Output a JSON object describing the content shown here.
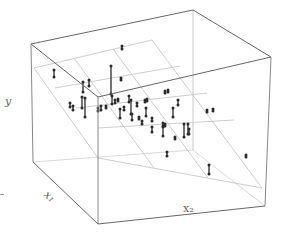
{
  "chart_data": {
    "type": "scatter3d",
    "title": "",
    "xlabel": "x1",
    "x2label": "x2",
    "ylabel": "y",
    "grid": false,
    "legend": null,
    "box": {
      "top_back_left": [
        31,
        44
      ],
      "top_back_right": [
        193,
        10
      ],
      "top_front_right": [
        271,
        57
      ],
      "top_front_left": [
        98,
        97
      ],
      "bottom_back_left": [
        33,
        162
      ],
      "bottom_back_right": [
        193,
        150
      ],
      "bottom_front_right": [
        265,
        206
      ],
      "bottom_front_left": [
        98,
        224
      ]
    },
    "plane": {
      "corners": [
        [
          34,
          68
        ],
        [
          152,
          40
        ],
        [
          262,
          188
        ],
        [
          98,
          158
        ]
      ],
      "grid_u": [
        [
          [
            34,
            68
          ],
          [
            152,
            40
          ]
        ],
        [
          [
            55,
            88
          ],
          [
            180,
            66
          ]
        ],
        [
          [
            76,
            108
          ],
          [
            207,
            93
          ]
        ],
        [
          [
            98,
            128
          ],
          [
            234,
            120
          ]
        ],
        [
          [
            98,
            158
          ],
          [
            262,
            188
          ]
        ]
      ],
      "grid_v": [
        [
          [
            34,
            68
          ],
          [
            98,
            158
          ]
        ],
        [
          [
            74,
            58
          ],
          [
            154,
            168
          ]
        ],
        [
          [
            113,
            49
          ],
          [
            208,
            178
          ]
        ],
        [
          [
            152,
            40
          ],
          [
            262,
            188
          ]
        ]
      ]
    },
    "points": [
      {
        "x": 54,
        "top": 70,
        "bottom": 77
      },
      {
        "x": 83,
        "top": 82,
        "bottom": 92
      },
      {
        "x": 89,
        "top": 80,
        "bottom": 86
      },
      {
        "x": 111,
        "top": 66,
        "bottom": 94
      },
      {
        "x": 121,
        "top": 78,
        "bottom": 80
      },
      {
        "x": 82,
        "top": 97,
        "bottom": 108
      },
      {
        "x": 73,
        "top": 106,
        "bottom": 110
      },
      {
        "x": 85,
        "top": 98,
        "bottom": 117
      },
      {
        "x": 98,
        "top": 108,
        "bottom": 111
      },
      {
        "x": 101,
        "top": 106,
        "bottom": 110
      },
      {
        "x": 106,
        "top": 106,
        "bottom": 108
      },
      {
        "x": 112,
        "top": 96,
        "bottom": 104
      },
      {
        "x": 115,
        "top": 100,
        "bottom": 103
      },
      {
        "x": 118,
        "top": 99,
        "bottom": 101
      },
      {
        "x": 124,
        "top": 107,
        "bottom": 110
      },
      {
        "x": 129,
        "top": 96,
        "bottom": 102
      },
      {
        "x": 131,
        "top": 100,
        "bottom": 114
      },
      {
        "x": 137,
        "top": 103,
        "bottom": 106
      },
      {
        "x": 146,
        "top": 108,
        "bottom": 116
      },
      {
        "x": 120,
        "top": 109,
        "bottom": 118
      },
      {
        "x": 132,
        "top": 114,
        "bottom": 120
      },
      {
        "x": 139,
        "top": 117,
        "bottom": 119
      },
      {
        "x": 145,
        "top": 100,
        "bottom": 102
      },
      {
        "x": 147,
        "top": 99,
        "bottom": 101
      },
      {
        "x": 152,
        "top": 118,
        "bottom": 121
      },
      {
        "x": 163,
        "top": 123,
        "bottom": 126
      },
      {
        "x": 165,
        "top": 91,
        "bottom": 93
      },
      {
        "x": 168,
        "top": 90,
        "bottom": 92
      },
      {
        "x": 173,
        "top": 108,
        "bottom": 117
      },
      {
        "x": 178,
        "top": 100,
        "bottom": 105
      },
      {
        "x": 184,
        "top": 124,
        "bottom": 137
      },
      {
        "x": 188,
        "top": 124,
        "bottom": 134
      },
      {
        "x": 189,
        "top": 129,
        "bottom": 134
      },
      {
        "x": 163,
        "top": 127,
        "bottom": 136
      },
      {
        "x": 152,
        "top": 127,
        "bottom": 132
      },
      {
        "x": 165,
        "top": 124,
        "bottom": 126
      },
      {
        "x": 167,
        "top": 152,
        "bottom": 156
      },
      {
        "x": 209,
        "top": 165,
        "bottom": 174
      },
      {
        "x": 246,
        "top": 155,
        "bottom": 157
      },
      {
        "x": 207,
        "top": 110,
        "bottom": 112
      },
      {
        "x": 213,
        "top": 109,
        "bottom": 111
      },
      {
        "x": 175,
        "top": 137,
        "bottom": 139
      },
      {
        "x": 122,
        "top": 46,
        "bottom": 49
      },
      {
        "x": 142,
        "top": 121,
        "bottom": 124
      },
      {
        "x": 70,
        "top": 103,
        "bottom": 107
      }
    ]
  },
  "labels": {
    "y": "y",
    "x1": "x₁",
    "x2": "x₂"
  },
  "colors": {
    "box": "#888888",
    "box_front": "#666666",
    "plane_grid": "#c8c8c8",
    "points": "#2a2a2a"
  }
}
